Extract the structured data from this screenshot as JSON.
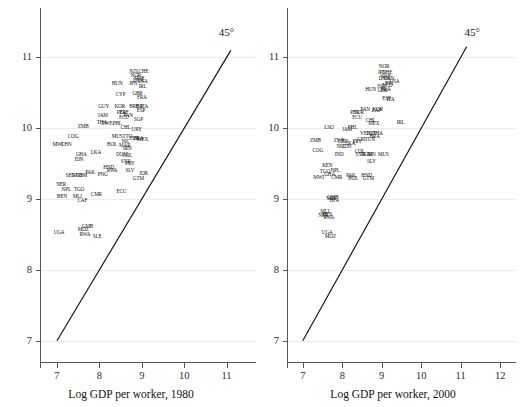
{
  "figure": {
    "type": "two-panel-scatter",
    "background": "#ffffff",
    "line_color": "#111111",
    "grid_color": "#ececec"
  },
  "chart_data": [
    {
      "panel": "left",
      "type": "scatter",
      "title": "",
      "xlabel": "Log GDP per worker, 1980",
      "ylabel": "",
      "xlim": [
        6.6,
        11.6
      ],
      "ylim": [
        6.7,
        11.5
      ],
      "xticks": [
        7,
        8,
        9,
        10,
        11
      ],
      "yticks": [
        7,
        8,
        9,
        10,
        11
      ],
      "grid": true,
      "annotations": [
        {
          "text": "45°",
          "x": 11.05,
          "y": 11.35
        }
      ],
      "reference_line": {
        "type": "45-degree",
        "from": [
          7,
          7
        ],
        "to": [
          11.1,
          11.1
        ]
      },
      "point_label_type": "country-iso3",
      "points": [
        {
          "label": "UGA",
          "x": 7.05,
          "y": 8.52
        },
        {
          "label": "MOZ",
          "x": 7.62,
          "y": 8.56
        },
        {
          "label": "GMB",
          "x": 7.72,
          "y": 8.6
        },
        {
          "label": "RWA",
          "x": 7.66,
          "y": 8.49
        },
        {
          "label": "SLE",
          "x": 7.95,
          "y": 8.46
        },
        {
          "label": "BEN",
          "x": 7.12,
          "y": 9.03
        },
        {
          "label": "MLI",
          "x": 7.48,
          "y": 9.03
        },
        {
          "label": "CAF",
          "x": 7.6,
          "y": 8.98
        },
        {
          "label": "NER",
          "x": 7.1,
          "y": 9.2
        },
        {
          "label": "NPL",
          "x": 7.22,
          "y": 9.13
        },
        {
          "label": "TGO",
          "x": 7.52,
          "y": 9.13
        },
        {
          "label": "CMR",
          "x": 7.93,
          "y": 9.06
        },
        {
          "label": "ECU",
          "x": 8.52,
          "y": 9.1
        },
        {
          "label": "SEN",
          "x": 7.32,
          "y": 9.33
        },
        {
          "label": "GNB",
          "x": 7.47,
          "y": 9.33
        },
        {
          "label": "COM",
          "x": 7.58,
          "y": 9.33
        },
        {
          "label": "PAK",
          "x": 7.78,
          "y": 9.37
        },
        {
          "label": "PNG",
          "x": 8.08,
          "y": 9.34
        },
        {
          "label": "RWA",
          "x": 8.3,
          "y": 9.39
        },
        {
          "label": "HND",
          "x": 8.22,
          "y": 9.44
        },
        {
          "label": "SLV",
          "x": 8.72,
          "y": 9.4
        },
        {
          "label": "JOR",
          "x": 9.04,
          "y": 9.36
        },
        {
          "label": "GTM",
          "x": 8.92,
          "y": 9.29
        },
        {
          "label": "IDN",
          "x": 7.52,
          "y": 9.55
        },
        {
          "label": "GHA",
          "x": 7.57,
          "y": 9.62
        },
        {
          "label": "LKA",
          "x": 7.92,
          "y": 9.65
        },
        {
          "label": "MWI",
          "x": 7.02,
          "y": 9.76
        },
        {
          "label": "CHN",
          "x": 7.22,
          "y": 9.76
        },
        {
          "label": "COG",
          "x": 7.38,
          "y": 9.88
        },
        {
          "label": "ZMB",
          "x": 7.62,
          "y": 10.02
        },
        {
          "label": "BOL",
          "x": 8.3,
          "y": 9.77
        },
        {
          "label": "MAR",
          "x": 8.6,
          "y": 9.75
        },
        {
          "label": "IRN",
          "x": 8.66,
          "y": 9.71
        },
        {
          "label": "NIC",
          "x": 8.62,
          "y": 9.8
        },
        {
          "label": "DOM",
          "x": 8.53,
          "y": 9.62
        },
        {
          "label": "COL",
          "x": 8.66,
          "y": 9.61
        },
        {
          "label": "SYR",
          "x": 8.62,
          "y": 9.52
        },
        {
          "label": "PRY",
          "x": 8.72,
          "y": 9.5
        },
        {
          "label": "MUS",
          "x": 8.42,
          "y": 9.88
        },
        {
          "label": "TTO",
          "x": 8.66,
          "y": 9.88
        },
        {
          "label": "TUR",
          "x": 8.82,
          "y": 9.85
        },
        {
          "label": "BRA",
          "x": 8.92,
          "y": 9.85
        },
        {
          "label": "MEX",
          "x": 9.02,
          "y": 9.83
        },
        {
          "label": "THA",
          "x": 8.06,
          "y": 10.08
        },
        {
          "label": "ZWE",
          "x": 8.18,
          "y": 10.06
        },
        {
          "label": "PHL",
          "x": 8.42,
          "y": 10.06
        },
        {
          "label": "CHL",
          "x": 8.62,
          "y": 10.0
        },
        {
          "label": "URY",
          "x": 8.88,
          "y": 9.97
        },
        {
          "label": "JAM",
          "x": 8.08,
          "y": 10.18
        },
        {
          "label": "ECU",
          "x": 8.58,
          "y": 10.14
        },
        {
          "label": "PAN",
          "x": 8.68,
          "y": 10.17
        },
        {
          "label": "SGP",
          "x": 8.92,
          "y": 10.12
        },
        {
          "label": "GUY",
          "x": 8.1,
          "y": 10.3
        },
        {
          "label": "KOR",
          "x": 8.48,
          "y": 10.3
        },
        {
          "label": "PER",
          "x": 8.52,
          "y": 10.22
        },
        {
          "label": "ZAF",
          "x": 8.58,
          "y": 10.22
        },
        {
          "label": "BRB",
          "x": 8.82,
          "y": 10.3
        },
        {
          "label": "ISR",
          "x": 8.94,
          "y": 10.3
        },
        {
          "label": "ITA",
          "x": 9.06,
          "y": 10.3
        },
        {
          "label": "ESP",
          "x": 8.98,
          "y": 10.25
        },
        {
          "label": "CYP",
          "x": 8.5,
          "y": 10.47
        },
        {
          "label": "GBR",
          "x": 8.9,
          "y": 10.48
        },
        {
          "label": "FRA",
          "x": 9.0,
          "y": 10.43
        },
        {
          "label": "HUN",
          "x": 8.42,
          "y": 10.62
        },
        {
          "label": "IRL",
          "x": 9.02,
          "y": 10.58
        },
        {
          "label": "USA",
          "x": 9.02,
          "y": 10.65
        },
        {
          "label": "JPN",
          "x": 8.8,
          "y": 10.63
        },
        {
          "label": "DNK",
          "x": 8.92,
          "y": 10.67
        },
        {
          "label": "SWE",
          "x": 8.94,
          "y": 10.7
        },
        {
          "label": "NOR",
          "x": 8.86,
          "y": 10.74
        },
        {
          "label": "NZL",
          "x": 8.82,
          "y": 10.8
        },
        {
          "label": "CHE",
          "x": 9.04,
          "y": 10.8
        }
      ]
    },
    {
      "panel": "right",
      "type": "scatter",
      "title": "",
      "xlabel": "Log GDP per worker, 2000",
      "ylabel": "",
      "xlim": [
        6.6,
        12.3
      ],
      "ylim": [
        6.7,
        11.5
      ],
      "xticks": [
        7,
        8,
        9,
        10,
        11,
        12
      ],
      "yticks": [
        7,
        8,
        9,
        10,
        11
      ],
      "grid": true,
      "annotations": [
        {
          "text": "45°",
          "x": 11.35,
          "y": 11.35
        }
      ],
      "reference_line": {
        "type": "45-degree",
        "from": [
          7,
          7
        ],
        "to": [
          11.15,
          11.15
        ]
      },
      "point_label_type": "country-iso3",
      "points": [
        {
          "label": "UGA",
          "x": 7.62,
          "y": 8.52
        },
        {
          "label": "MOZ",
          "x": 7.7,
          "y": 8.47
        },
        {
          "label": "MLI",
          "x": 7.56,
          "y": 8.82
        },
        {
          "label": "NER",
          "x": 7.52,
          "y": 8.76
        },
        {
          "label": "BEN",
          "x": 7.62,
          "y": 8.78
        },
        {
          "label": "RWA",
          "x": 7.66,
          "y": 8.74
        },
        {
          "label": "GMB",
          "x": 7.76,
          "y": 9.02
        },
        {
          "label": "SEN",
          "x": 7.72,
          "y": 9.0
        },
        {
          "label": "BFA",
          "x": 7.8,
          "y": 8.98
        },
        {
          "label": "MWI",
          "x": 7.4,
          "y": 9.3
        },
        {
          "label": "TGO",
          "x": 7.56,
          "y": 9.38
        },
        {
          "label": "GHA",
          "x": 7.68,
          "y": 9.34
        },
        {
          "label": "NPL",
          "x": 7.82,
          "y": 9.4
        },
        {
          "label": "CMR",
          "x": 7.86,
          "y": 9.3
        },
        {
          "label": "KEN",
          "x": 7.62,
          "y": 9.47
        },
        {
          "label": "PAK",
          "x": 8.22,
          "y": 9.32
        },
        {
          "label": "BOL",
          "x": 8.28,
          "y": 9.28
        },
        {
          "label": "HND",
          "x": 8.62,
          "y": 9.32
        },
        {
          "label": "GTM",
          "x": 8.66,
          "y": 9.28
        },
        {
          "label": "SLV",
          "x": 8.74,
          "y": 9.52
        },
        {
          "label": "COG",
          "x": 7.38,
          "y": 9.68
        },
        {
          "label": "IND",
          "x": 7.92,
          "y": 9.62
        },
        {
          "label": "ZMB",
          "x": 7.32,
          "y": 9.82
        },
        {
          "label": "ZWE",
          "x": 7.92,
          "y": 9.82
        },
        {
          "label": "CHN",
          "x": 8.02,
          "y": 9.8
        },
        {
          "label": "NIC",
          "x": 7.96,
          "y": 9.74
        },
        {
          "label": "IDN",
          "x": 8.12,
          "y": 9.74
        },
        {
          "label": "LKA",
          "x": 8.2,
          "y": 9.78
        },
        {
          "label": "PRY",
          "x": 8.38,
          "y": 9.8
        },
        {
          "label": "COL",
          "x": 8.44,
          "y": 9.66
        },
        {
          "label": "SYR",
          "x": 8.46,
          "y": 9.62
        },
        {
          "label": "DOM",
          "x": 8.62,
          "y": 9.62
        },
        {
          "label": "IRN",
          "x": 8.74,
          "y": 9.62
        },
        {
          "label": "MUS",
          "x": 9.04,
          "y": 9.62
        },
        {
          "label": "LSO",
          "x": 7.66,
          "y": 10.0
        },
        {
          "label": "JAM",
          "x": 8.12,
          "y": 9.98
        },
        {
          "label": "PHL",
          "x": 8.26,
          "y": 10.0
        },
        {
          "label": "CRI",
          "x": 8.48,
          "y": 9.84
        },
        {
          "label": "TUN",
          "x": 8.7,
          "y": 9.84
        },
        {
          "label": "BRA",
          "x": 8.82,
          "y": 9.88
        },
        {
          "label": "VEN",
          "x": 8.58,
          "y": 9.92
        },
        {
          "label": "URY",
          "x": 8.74,
          "y": 9.92
        },
        {
          "label": "THA",
          "x": 8.9,
          "y": 9.92
        },
        {
          "label": "MEX",
          "x": 8.8,
          "y": 10.06
        },
        {
          "label": "CHL",
          "x": 8.72,
          "y": 10.1
        },
        {
          "label": "ECU",
          "x": 8.38,
          "y": 10.14
        },
        {
          "label": "PER",
          "x": 8.32,
          "y": 10.22
        },
        {
          "label": "TUR",
          "x": 8.42,
          "y": 10.22
        },
        {
          "label": "PAN",
          "x": 8.58,
          "y": 10.26
        },
        {
          "label": "ZAF",
          "x": 8.86,
          "y": 10.24
        },
        {
          "label": "KOR",
          "x": 8.9,
          "y": 10.26
        },
        {
          "label": "IRL",
          "x": 9.48,
          "y": 10.08
        },
        {
          "label": "ESP",
          "x": 9.12,
          "y": 10.42
        },
        {
          "label": "ITA",
          "x": 9.22,
          "y": 10.4
        },
        {
          "label": "GBR",
          "x": 9.02,
          "y": 10.52
        },
        {
          "label": "HUN",
          "x": 8.72,
          "y": 10.54
        },
        {
          "label": "FRA",
          "x": 9.1,
          "y": 10.54
        },
        {
          "label": "ISR",
          "x": 8.98,
          "y": 10.58
        },
        {
          "label": "NLD",
          "x": 9.14,
          "y": 10.6
        },
        {
          "label": "BEL",
          "x": 9.2,
          "y": 10.62
        },
        {
          "label": "USA",
          "x": 9.32,
          "y": 10.66
        },
        {
          "label": "DNK",
          "x": 9.06,
          "y": 10.7
        },
        {
          "label": "SWE",
          "x": 9.1,
          "y": 10.72
        },
        {
          "label": "CAN",
          "x": 9.18,
          "y": 10.7
        },
        {
          "label": "JPN",
          "x": 9.0,
          "y": 10.78
        },
        {
          "label": "CHE",
          "x": 9.14,
          "y": 10.78
        },
        {
          "label": "NOR",
          "x": 9.06,
          "y": 10.86
        }
      ]
    }
  ]
}
